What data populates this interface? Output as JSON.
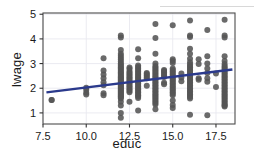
{
  "figure": {
    "background": "#ffffff",
    "panel_background": "#ffffff",
    "panel_border_color": "#4d4d4d",
    "grid_color": "#e9e9ef",
    "tick_color": "#333333",
    "point_color": "#555555",
    "line_color": "#2b3a8c"
  },
  "chart_data": {
    "type": "scatter",
    "title": "",
    "xlabel": "educ",
    "ylabel": "lwage",
    "xlim": [
      7.5,
      18.6
    ],
    "ylim": [
      0.55,
      5.05
    ],
    "xticks": [
      7.5,
      10.0,
      12.5,
      15.0,
      17.5
    ],
    "xticklabels": [
      "7.5",
      "10.0",
      "12.5",
      "15.0",
      "17.5"
    ],
    "yticks": [
      1,
      2,
      3,
      4,
      5
    ],
    "yticklabels": [
      "1",
      "2",
      "3",
      "4",
      "5"
    ],
    "grid": true,
    "legend": "none",
    "marker": "filled-circle",
    "marker_size": 3.0,
    "series": [
      {
        "name": "observations",
        "color": "#555555",
        "x": [
          8,
          8,
          10,
          10,
          10,
          10,
          11,
          11,
          11,
          11,
          11,
          11,
          11,
          11,
          12,
          12,
          12,
          12,
          12,
          12,
          12,
          12,
          12,
          12,
          12,
          12,
          12,
          12,
          12,
          12,
          12,
          12,
          12,
          12,
          12,
          12,
          12,
          12,
          12,
          12,
          12,
          12,
          12,
          12,
          12,
          12,
          12,
          12,
          12,
          12,
          12,
          12,
          12,
          12,
          12,
          12,
          12,
          12,
          12,
          12,
          12.5,
          12.5,
          12.5,
          12.5,
          12.5,
          12.5,
          12.5,
          12.5,
          12.5,
          12.5,
          12.5,
          12.5,
          12.5,
          12.5,
          12.5,
          12.5,
          12.5,
          12.5,
          13,
          13,
          13,
          13,
          13,
          13,
          13,
          13,
          13,
          13,
          13,
          13,
          13,
          13,
          13,
          13,
          13,
          13,
          13,
          13,
          13,
          13,
          13,
          13,
          13,
          13,
          13.5,
          13.5,
          13.5,
          13.5,
          13.5,
          13.5,
          14,
          14,
          14,
          14,
          14,
          14,
          14,
          14,
          14,
          14,
          14,
          14,
          14,
          14,
          14,
          14,
          14,
          14,
          14,
          14,
          14,
          14,
          14,
          14,
          14,
          14,
          14,
          14,
          14,
          14,
          14,
          14,
          14.5,
          14.5,
          14.5,
          14.5,
          14.5,
          14.5,
          14.5,
          14.5,
          15,
          15,
          15,
          15,
          15,
          15,
          15,
          15,
          15,
          15,
          15,
          15,
          15,
          15,
          15,
          15,
          15,
          15,
          15,
          15,
          15,
          15,
          15,
          15,
          15,
          15,
          15.5,
          15.5,
          15.5,
          16,
          16,
          16,
          16,
          16,
          16,
          16,
          16,
          16,
          16,
          16,
          16,
          16,
          16,
          16,
          16,
          16,
          16,
          16,
          16,
          16,
          16,
          16,
          16,
          16,
          16,
          16,
          16,
          16,
          16,
          16,
          16,
          16.5,
          16.5,
          16.5,
          16.5,
          17,
          17,
          17,
          17,
          17,
          17,
          17,
          17,
          17.5,
          17.5,
          18,
          18,
          18,
          18,
          18,
          18,
          18,
          18,
          18,
          18,
          18,
          18,
          18,
          18,
          18,
          18,
          18,
          18,
          18,
          18,
          18,
          18,
          18,
          18,
          18,
          18,
          18,
          18,
          18,
          18,
          18,
          18,
          18,
          18,
          18
        ],
        "y": [
          1.52,
          1.52,
          2.02,
          1.94,
          1.82,
          1.75,
          3.22,
          2.72,
          2.56,
          2.4,
          2.24,
          2.12,
          1.8,
          1.72,
          4.14,
          4.06,
          3.55,
          3.4,
          3.32,
          3.24,
          3.16,
          3.08,
          3.0,
          2.95,
          2.9,
          2.85,
          2.8,
          2.75,
          2.7,
          2.65,
          2.6,
          2.55,
          2.5,
          2.46,
          2.42,
          2.38,
          2.34,
          2.3,
          2.26,
          2.22,
          2.18,
          2.14,
          2.1,
          2.06,
          2.02,
          1.98,
          1.94,
          1.9,
          1.86,
          1.82,
          1.78,
          1.74,
          1.7,
          1.66,
          1.62,
          1.58,
          1.45,
          1.3,
          1.0,
          0.8,
          2.84,
          2.78,
          2.68,
          2.62,
          2.56,
          2.5,
          2.44,
          2.38,
          2.32,
          2.26,
          2.2,
          2.14,
          2.08,
          2.02,
          1.96,
          1.9,
          1.84,
          1.45,
          3.58,
          3.22,
          2.92,
          2.86,
          2.8,
          2.74,
          2.68,
          2.62,
          2.56,
          2.5,
          2.44,
          2.38,
          2.32,
          2.26,
          2.2,
          2.14,
          2.08,
          2.02,
          1.96,
          1.9,
          1.84,
          1.78,
          1.72,
          1.66,
          1.6,
          1.1,
          2.62,
          2.58,
          2.52,
          2.46,
          2.4,
          2.1,
          4.6,
          4.04,
          3.4,
          3.0,
          2.9,
          2.84,
          2.78,
          2.72,
          2.66,
          2.6,
          2.54,
          2.48,
          2.42,
          2.36,
          2.3,
          2.24,
          2.18,
          2.12,
          2.06,
          2.0,
          1.94,
          1.88,
          1.82,
          1.76,
          1.7,
          1.64,
          1.58,
          1.52,
          1.46,
          1.4,
          1.34,
          1.15,
          2.74,
          2.7,
          2.64,
          2.58,
          2.52,
          2.46,
          2.22,
          2.16,
          4.55,
          3.18,
          3.1,
          3.02,
          2.8,
          2.74,
          2.68,
          2.62,
          2.56,
          2.5,
          2.44,
          2.38,
          2.32,
          2.26,
          2.2,
          2.14,
          2.08,
          2.02,
          1.96,
          1.9,
          1.84,
          1.78,
          1.72,
          1.5,
          1.32,
          1.2,
          2.6,
          2.44,
          2.28,
          4.75,
          4.14,
          4.08,
          3.6,
          3.4,
          3.2,
          3.05,
          2.96,
          2.9,
          2.84,
          2.78,
          2.72,
          2.66,
          2.6,
          2.54,
          2.48,
          2.42,
          2.36,
          2.3,
          2.24,
          2.18,
          2.12,
          2.06,
          2.0,
          1.94,
          1.88,
          1.82,
          1.76,
          1.7,
          1.64,
          1.58,
          0.92,
          3.18,
          2.98,
          2.4,
          2.34,
          4.36,
          3.3,
          3.0,
          2.8,
          2.62,
          2.4,
          2.26,
          0.9,
          2.6,
          2.05,
          4.78,
          4.14,
          4.06,
          3.3,
          3.1,
          2.98,
          2.9,
          2.84,
          2.78,
          2.72,
          2.66,
          2.6,
          2.54,
          2.48,
          2.42,
          2.36,
          2.3,
          2.24,
          2.18,
          2.12,
          2.06,
          2.0,
          1.94,
          1.88,
          1.82,
          1.76,
          1.7,
          1.64,
          1.58,
          1.52,
          1.46,
          1.4,
          1.34,
          1.3,
          1.26
        ]
      }
    ],
    "fit_line": {
      "name": "linear-fit",
      "color": "#2b3a8c",
      "width": 2.4,
      "x": [
        7.7,
        18.45
      ],
      "y": [
        1.83,
        2.76
      ]
    }
  }
}
